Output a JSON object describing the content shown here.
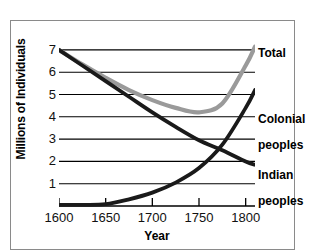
{
  "chart_data": {
    "type": "line",
    "title": "",
    "xlabel": "Year",
    "ylabel": "Millions of Individuals",
    "xlim": [
      1600,
      1810
    ],
    "ylim": [
      0,
      7.4
    ],
    "xticks": [
      1600,
      1650,
      1700,
      1750,
      1800
    ],
    "yticks": [
      1,
      2,
      3,
      4,
      5,
      6,
      7
    ],
    "grid": "horizontal",
    "legend_position": "right-inline-annotations",
    "series": [
      {
        "name": "Total",
        "color": "#9a9a9a",
        "x": [
          1600,
          1625,
          1650,
          1675,
          1700,
          1725,
          1750,
          1775,
          1800,
          1810
        ],
        "values": [
          7.0,
          6.35,
          5.75,
          5.2,
          4.75,
          4.4,
          4.2,
          4.6,
          6.3,
          7.15
        ]
      },
      {
        "name": "Indian peoples",
        "color": "#1a1a1a",
        "x": [
          1600,
          1625,
          1650,
          1675,
          1700,
          1725,
          1750,
          1775,
          1800,
          1810
        ],
        "values": [
          7.0,
          6.3,
          5.6,
          4.9,
          4.2,
          3.55,
          2.95,
          2.5,
          2.0,
          1.85
        ]
      },
      {
        "name": "Colonial peoples",
        "color": "#1a1a1a",
        "x": [
          1600,
          1625,
          1650,
          1675,
          1700,
          1725,
          1750,
          1775,
          1800,
          1810
        ],
        "values": [
          0.05,
          0.05,
          0.08,
          0.3,
          0.6,
          1.05,
          1.7,
          2.75,
          4.4,
          5.2
        ]
      }
    ],
    "annotations": [
      {
        "text": "Total",
        "series": "Total"
      },
      {
        "text": "Colonial\npeoples",
        "series": "Colonial peoples"
      },
      {
        "text": "Indian\npeoples",
        "series": "Indian peoples"
      }
    ]
  },
  "axes": {
    "y_title": "Millions of Individuals",
    "x_title": "Year",
    "y_tick_labels": [
      "7",
      "6",
      "5",
      "4",
      "3",
      "2",
      "1"
    ],
    "x_tick_labels": [
      "1600",
      "1650",
      "1700",
      "1750",
      "1800"
    ]
  },
  "labels": {
    "total": "Total",
    "colonial_line1": "Colonial",
    "colonial_line2": "peoples",
    "indian_line1": "Indian",
    "indian_line2": "peoples"
  }
}
